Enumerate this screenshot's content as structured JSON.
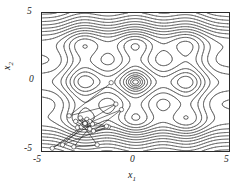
{
  "figure": {
    "type": "contour-plot-with-trajectory",
    "background": "#ffffff",
    "line_color": "#333333"
  },
  "axes": {
    "x_title": "x",
    "x_title_sub": "1",
    "y_title": "x",
    "y_title_sub": "2",
    "x_ticks": [
      "-5",
      "0",
      "5"
    ],
    "y_ticks": [
      "5",
      "0",
      "-5"
    ],
    "x_tick_values": [
      -5,
      0,
      5
    ],
    "y_tick_values": [
      5,
      0,
      -5
    ]
  },
  "chart_data": {
    "type": "line",
    "title": "",
    "subtitle": "",
    "xlabel": "x1",
    "ylabel": "x2",
    "xlim": [
      -5,
      5
    ],
    "ylim": [
      -5,
      5
    ],
    "grid": false,
    "legend": "none",
    "annotations": [],
    "contour_levels": [
      0.5,
      1.5,
      3,
      5,
      8,
      12,
      17,
      23,
      30,
      38,
      47,
      57,
      68,
      80,
      93,
      107,
      122,
      138,
      155,
      173,
      192,
      212,
      233,
      255,
      278,
      302,
      327,
      353,
      380
    ],
    "contour_line_color": "#333333",
    "minima": [
      {
        "x": -2.65,
        "y": 3.05,
        "label": "upper-left local minimum"
      },
      {
        "x": 2.85,
        "y": 3.05,
        "label": "upper-right local minimum"
      },
      {
        "x": 0.0,
        "y": 0.0,
        "label": "central local minimum"
      },
      {
        "x": 2.85,
        "y": -3.0,
        "label": "lower-right local minimum"
      },
      {
        "x": -2.7,
        "y": -3.0,
        "label": "lower-left minimum (converged)"
      }
    ],
    "series": [
      {
        "name": "search trajectory",
        "marker": "open-circle",
        "marker_size": 2.2,
        "line_width": 0.6,
        "color": "#1a1a1a",
        "points": [
          [
            -1.3,
            -0.05
          ],
          [
            -3.55,
            -2.45
          ],
          [
            -1.05,
            -1.6
          ],
          [
            -3.1,
            -3.3
          ],
          [
            -0.75,
            -2.0
          ],
          [
            -2.25,
            -3.55
          ],
          [
            -1.45,
            -3.25
          ],
          [
            -3.9,
            -4.55
          ],
          [
            -2.55,
            -2.95
          ],
          [
            -4.45,
            -4.8
          ],
          [
            -2.3,
            -3.05
          ],
          [
            -3.3,
            -4.7
          ],
          [
            -2.05,
            -4.55
          ],
          [
            -2.8,
            -3.15
          ],
          [
            -1.55,
            -3.2
          ],
          [
            -2.95,
            -2.6
          ],
          [
            -2.45,
            -3.4
          ],
          [
            -3.2,
            -2.85
          ],
          [
            -2.6,
            -2.7
          ],
          [
            -2.9,
            -3.25
          ],
          [
            -2.45,
            -2.85
          ],
          [
            -2.75,
            -3.1
          ],
          [
            -2.6,
            -2.95
          ],
          [
            -2.8,
            -3.05
          ],
          [
            -2.68,
            -2.98
          ],
          [
            -2.74,
            -3.02
          ],
          [
            -2.7,
            -2.99
          ],
          [
            -2.72,
            -3.01
          ],
          [
            -2.7,
            -3.0
          ],
          [
            -2.71,
            -3.0
          ],
          [
            -2.7,
            -3.0
          ],
          [
            -2.7,
            -3.0
          ]
        ]
      }
    ]
  }
}
